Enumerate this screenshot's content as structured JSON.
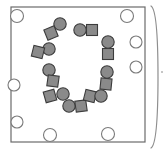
{
  "canvas": {
    "width": 163,
    "height": 154,
    "background": "#ffffff",
    "title": "Ring of alternating circles and squares inside a bordered frame"
  },
  "palette": {
    "frame_stroke": "#6b6b6b",
    "frame_fill": "#ffffff",
    "hole_stroke": "#7a7a7a",
    "hole_fill": "#ffffff",
    "shape_fill": "#8a8a8a",
    "shape_stroke": "#3c3c3c",
    "bracket_stroke": "#8e8e8e"
  },
  "frame": {
    "name": "board-frame",
    "x": 11,
    "y": 7,
    "width": 134,
    "height": 135,
    "stroke_width": 1.2,
    "label": "frame"
  },
  "right_bracket": {
    "name": "right-bracket",
    "path": "M 151 6 Q 158 10 158 77 Q 158 144 151 148",
    "stroke_width": 1.2,
    "label": ")"
  },
  "right_tick": {
    "name": "right-edge-tick",
    "x1": 161,
    "y1": 72,
    "x2": 163,
    "y2": 72,
    "label": "-"
  },
  "holes": [
    {
      "name": "hole-top-left",
      "cx": 17,
      "cy": 16,
      "r": 6.5
    },
    {
      "name": "hole-top-right",
      "cx": 127,
      "cy": 16,
      "r": 6.5
    },
    {
      "name": "hole-right-upper",
      "cx": 136,
      "cy": 42,
      "r": 6.0
    },
    {
      "name": "hole-right-middle",
      "cx": 136,
      "cy": 67,
      "r": 6.0
    },
    {
      "name": "hole-left-middle",
      "cx": 14,
      "cy": 85,
      "r": 6.0
    },
    {
      "name": "hole-left-lower",
      "cx": 17,
      "cy": 122,
      "r": 6.0
    },
    {
      "name": "hole-bottom-left",
      "cx": 50,
      "cy": 135,
      "r": 6.5
    },
    {
      "name": "hole-bottom-right",
      "cx": 108,
      "cy": 134,
      "r": 6.5
    }
  ],
  "ring": {
    "name": "shape-ring",
    "description": "open ring of alternating gray circles and squares",
    "circle_r": 6.2,
    "square_size": 11.0,
    "items": [
      {
        "name": "ring-circle-1",
        "type": "circle",
        "cx": 60,
        "cy": 24,
        "rot": 0
      },
      {
        "name": "ring-square-1",
        "type": "square",
        "cx": 51,
        "cy": 33,
        "rot": -22
      },
      {
        "name": "ring-circle-2",
        "type": "circle",
        "cx": 49,
        "cy": 49,
        "rot": 0
      },
      {
        "name": "ring-square-2",
        "type": "square",
        "cx": 38,
        "cy": 52,
        "rot": 14
      },
      {
        "name": "ring-circle-3",
        "type": "circle",
        "cx": 49,
        "cy": 70,
        "rot": 0
      },
      {
        "name": "ring-square-3",
        "type": "square",
        "cx": 53,
        "cy": 81,
        "rot": 8
      },
      {
        "name": "ring-square-4",
        "type": "square",
        "cx": 50,
        "cy": 96,
        "rot": -16
      },
      {
        "name": "ring-circle-4",
        "type": "circle",
        "cx": 63,
        "cy": 94,
        "rot": 0
      },
      {
        "name": "ring-circle-5",
        "type": "circle",
        "cx": 69,
        "cy": 106,
        "rot": 0
      },
      {
        "name": "ring-square-5",
        "type": "square",
        "cx": 81,
        "cy": 106,
        "rot": -8
      },
      {
        "name": "ring-square-6",
        "type": "square",
        "cx": 90,
        "cy": 96,
        "rot": 14
      },
      {
        "name": "ring-circle-6",
        "type": "circle",
        "cx": 101,
        "cy": 96,
        "rot": 0
      },
      {
        "name": "ring-square-7",
        "type": "square",
        "cx": 106,
        "cy": 84,
        "rot": 6
      },
      {
        "name": "ring-circle-7",
        "type": "circle",
        "cx": 107,
        "cy": 72,
        "rot": 0
      },
      {
        "name": "ring-square-8",
        "type": "square",
        "cx": 108,
        "cy": 54,
        "rot": 0
      },
      {
        "name": "ring-circle-8",
        "type": "circle",
        "cx": 108,
        "cy": 42,
        "rot": 0
      },
      {
        "name": "ring-square-9",
        "type": "square",
        "cx": 92,
        "cy": 30,
        "rot": 0
      },
      {
        "name": "ring-circle-9",
        "type": "circle",
        "cx": 80,
        "cy": 30,
        "rot": 0
      }
    ]
  }
}
